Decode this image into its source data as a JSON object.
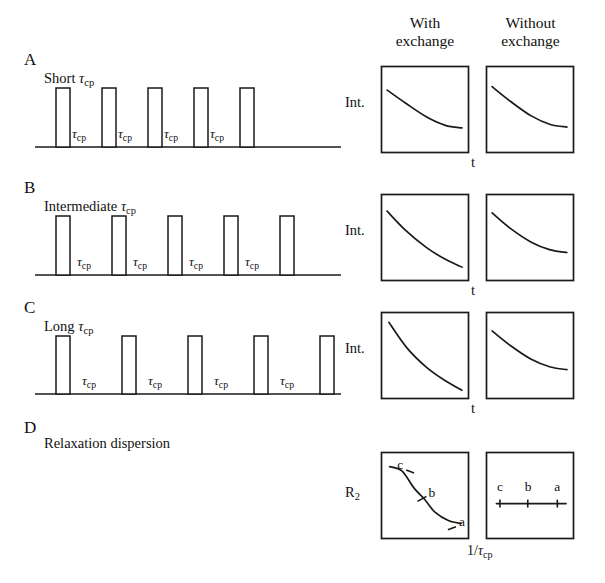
{
  "figure": {
    "kind": "nmr-cpmg-relaxation-dispersion-schematic",
    "width": 605,
    "height": 583,
    "background": "#ffffff",
    "ink_color": "#1a1a1a"
  },
  "column_headers": [
    {
      "id": "with-exchange",
      "line1": "With",
      "line2": "exchange",
      "x": 424,
      "y": 14
    },
    {
      "id": "without-exchange",
      "line1": "Without",
      "line2": "exchange",
      "x": 527,
      "y": 14
    }
  ],
  "panels": [
    {
      "id": "A",
      "letter": "A",
      "caption_prefix": "Short ",
      "caption_symbol": "τ",
      "caption_subscript": "cp",
      "letter_pos": {
        "x": 24,
        "y": 56
      },
      "caption_pos": {
        "x": 44,
        "y": 76
      },
      "pulse_train": {
        "label": "τ",
        "label_subscript": "cp",
        "n_pulses": 5,
        "n_gaps": 4,
        "first_pulse_x": 56,
        "pulse_width": 14,
        "period": 46,
        "baseline_y": 147,
        "pulse_top_y": 88,
        "baseline_x_start": 35,
        "baseline_x_end": 341,
        "gap_label_y": 126
      },
      "intensity_axis_label": "Int.",
      "time_axis_label": "t",
      "plots": [
        {
          "id": "A-with",
          "column": "with-exchange",
          "box": {
            "x": 381,
            "y": 66,
            "w": 87,
            "h": 86
          },
          "curve_kind": "exponential-decay",
          "decay_strength": "shallow",
          "points": [
            [
              0.07,
              0.28
            ],
            [
              0.28,
              0.43
            ],
            [
              0.52,
              0.59
            ],
            [
              0.74,
              0.69
            ],
            [
              0.93,
              0.72
            ]
          ]
        },
        {
          "id": "A-without",
          "column": "without-exchange",
          "box": {
            "x": 486,
            "y": 66,
            "w": 87,
            "h": 86
          },
          "curve_kind": "exponential-decay",
          "decay_strength": "shallow",
          "points": [
            [
              0.07,
              0.24
            ],
            [
              0.28,
              0.41
            ],
            [
              0.52,
              0.58
            ],
            [
              0.74,
              0.68
            ],
            [
              0.93,
              0.71
            ]
          ]
        }
      ]
    },
    {
      "id": "B",
      "letter": "B",
      "caption_prefix": "Intermediate ",
      "caption_symbol": "τ",
      "caption_subscript": "cp",
      "letter_pos": {
        "x": 24,
        "y": 184
      },
      "caption_pos": {
        "x": 44,
        "y": 204
      },
      "pulse_train": {
        "label": "τ",
        "label_subscript": "cp",
        "n_pulses": 5,
        "n_gaps": 4,
        "first_pulse_x": 56,
        "pulse_width": 14,
        "period": 56,
        "baseline_y": 275,
        "pulse_top_y": 216,
        "baseline_x_start": 35,
        "baseline_x_end": 341,
        "gap_label_y": 254
      },
      "intensity_axis_label": "Int.",
      "time_axis_label": "t",
      "plots": [
        {
          "id": "B-with",
          "column": "with-exchange",
          "box": {
            "x": 381,
            "y": 194,
            "w": 87,
            "h": 86
          },
          "curve_kind": "exponential-decay",
          "decay_strength": "medium",
          "points": [
            [
              0.07,
              0.2
            ],
            [
              0.28,
              0.42
            ],
            [
              0.52,
              0.62
            ],
            [
              0.74,
              0.76
            ],
            [
              0.93,
              0.85
            ]
          ]
        },
        {
          "id": "B-without",
          "column": "without-exchange",
          "box": {
            "x": 486,
            "y": 194,
            "w": 87,
            "h": 86
          },
          "curve_kind": "exponential-decay",
          "decay_strength": "shallow",
          "points": [
            [
              0.07,
              0.22
            ],
            [
              0.28,
              0.4
            ],
            [
              0.52,
              0.56
            ],
            [
              0.74,
              0.65
            ],
            [
              0.93,
              0.68
            ]
          ]
        }
      ]
    },
    {
      "id": "C",
      "letter": "C",
      "caption_prefix": "Long ",
      "caption_symbol": "τ",
      "caption_subscript": "cp",
      "letter_pos": {
        "x": 24,
        "y": 304
      },
      "caption_pos": {
        "x": 44,
        "y": 324
      },
      "pulse_train": {
        "label": "τ",
        "label_subscript": "cp",
        "n_pulses": 5,
        "n_gaps": 4,
        "first_pulse_x": 56,
        "pulse_width": 14,
        "period": 66,
        "baseline_y": 394,
        "pulse_top_y": 336,
        "baseline_x_start": 35,
        "baseline_x_end": 341,
        "gap_label_y": 373
      },
      "intensity_axis_label": "Int.",
      "time_axis_label": "t",
      "plots": [
        {
          "id": "C-with",
          "column": "with-exchange",
          "box": {
            "x": 381,
            "y": 312,
            "w": 87,
            "h": 86
          },
          "curve_kind": "exponential-decay",
          "decay_strength": "steep",
          "points": [
            [
              0.09,
              0.12
            ],
            [
              0.3,
              0.42
            ],
            [
              0.52,
              0.64
            ],
            [
              0.74,
              0.8
            ],
            [
              0.93,
              0.91
            ]
          ]
        },
        {
          "id": "C-without",
          "column": "without-exchange",
          "box": {
            "x": 486,
            "y": 312,
            "w": 87,
            "h": 86
          },
          "curve_kind": "exponential-decay",
          "decay_strength": "shallow",
          "points": [
            [
              0.07,
              0.22
            ],
            [
              0.28,
              0.39
            ],
            [
              0.52,
              0.55
            ],
            [
              0.74,
              0.64
            ],
            [
              0.93,
              0.67
            ]
          ]
        }
      ]
    },
    {
      "id": "D",
      "letter": "D",
      "caption_prefix": "Relaxation dispersion",
      "caption_symbol": "",
      "caption_subscript": "",
      "letter_pos": {
        "x": 24,
        "y": 424
      },
      "caption_pos": {
        "x": 44,
        "y": 441
      },
      "pulse_train": null,
      "intensity_axis_label": "R",
      "intensity_axis_subscript": "2",
      "time_axis_label": "1/τ",
      "time_axis_subscript": "cp",
      "plots": [
        {
          "id": "D-with",
          "column": "with-exchange",
          "box": {
            "x": 381,
            "y": 452,
            "w": 87,
            "h": 86
          },
          "curve_kind": "sigmoidal-dispersion",
          "points": [
            [
              0.1,
              0.17
            ],
            [
              0.24,
              0.22
            ],
            [
              0.38,
              0.42
            ],
            [
              0.5,
              0.55
            ],
            [
              0.62,
              0.7
            ],
            [
              0.78,
              0.8
            ],
            [
              0.92,
              0.83
            ]
          ],
          "markers": [
            {
              "label": "c",
              "x": 0.22,
              "y": 0.14
            },
            {
              "label": "b",
              "x": 0.58,
              "y": 0.47
            },
            {
              "label": "a",
              "x": 0.93,
              "y": 0.8
            }
          ]
        },
        {
          "id": "D-without",
          "column": "without-exchange",
          "box": {
            "x": 486,
            "y": 452,
            "w": 87,
            "h": 86
          },
          "curve_kind": "flat-dispersion",
          "points": [
            [
              0.12,
              0.6
            ],
            [
              0.92,
              0.6
            ]
          ],
          "markers": [
            {
              "label": "c",
              "x": 0.16,
              "y": 0.4
            },
            {
              "label": "b",
              "x": 0.48,
              "y": 0.4
            },
            {
              "label": "a",
              "x": 0.82,
              "y": 0.4
            }
          ]
        }
      ]
    }
  ],
  "axis_labels": {
    "intensity": "Int.",
    "time": "t",
    "r2_symbol": "R",
    "r2_subscript": "2",
    "inv_tau_prefix": "1/",
    "inv_tau_symbol": "τ",
    "inv_tau_subscript": "cp"
  }
}
